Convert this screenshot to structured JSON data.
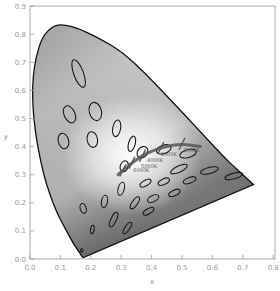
{
  "chart_data": {
    "type": "scatter",
    "title": "",
    "subtitle": "CIE 1931 chromaticity diagram with MacAdam ellipses and Planckian locus",
    "xlabel": "x",
    "ylabel": "y",
    "xlim": [
      0.0,
      0.8
    ],
    "ylim": [
      0.0,
      0.9
    ],
    "grid": false,
    "legend": null,
    "x_ticks": [
      "0.0",
      "0.1",
      "0.2",
      "0.3",
      "0.4",
      "0.5",
      "0.6",
      "0.7",
      "0.8"
    ],
    "y_ticks": [
      "0.0",
      "0.1",
      "0.2",
      "0.3",
      "0.4",
      "0.5",
      "0.6",
      "0.7",
      "0.8",
      "0.9"
    ],
    "spectral_locus": [
      [
        0.175,
        0.005
      ],
      [
        0.172,
        0.005
      ],
      [
        0.165,
        0.02
      ],
      [
        0.145,
        0.05
      ],
      [
        0.12,
        0.1
      ],
      [
        0.09,
        0.16
      ],
      [
        0.065,
        0.23
      ],
      [
        0.045,
        0.3
      ],
      [
        0.025,
        0.4
      ],
      [
        0.012,
        0.5
      ],
      [
        0.008,
        0.58
      ],
      [
        0.01,
        0.65
      ],
      [
        0.02,
        0.72
      ],
      [
        0.04,
        0.79
      ],
      [
        0.075,
        0.83
      ],
      [
        0.11,
        0.835
      ],
      [
        0.16,
        0.82
      ],
      [
        0.22,
        0.79
      ],
      [
        0.3,
        0.74
      ],
      [
        0.38,
        0.66
      ],
      [
        0.45,
        0.58
      ],
      [
        0.52,
        0.5
      ],
      [
        0.58,
        0.43
      ],
      [
        0.64,
        0.36
      ],
      [
        0.69,
        0.31
      ],
      [
        0.735,
        0.265
      ]
    ],
    "planckian_locus": {
      "points": [
        [
          0.29,
          0.3
        ],
        [
          0.31,
          0.32
        ],
        [
          0.345,
          0.35
        ],
        [
          0.38,
          0.375
        ],
        [
          0.44,
          0.4
        ],
        [
          0.5,
          0.41
        ],
        [
          0.56,
          0.4
        ]
      ],
      "labels": [
        {
          "text": "2000K",
          "x": 0.505,
          "y": 0.38
        },
        {
          "text": "3000K",
          "x": 0.43,
          "y": 0.365
        },
        {
          "text": "4000K",
          "x": 0.385,
          "y": 0.345
        },
        {
          "text": "5000K",
          "x": 0.365,
          "y": 0.325
        },
        {
          "text": "6000K",
          "x": 0.34,
          "y": 0.31
        }
      ]
    },
    "macadam_ellipses": [
      {
        "cx": 0.16,
        "cy": 0.66,
        "rx": 0.016,
        "ry": 0.052,
        "angle": -20
      },
      {
        "cx": 0.13,
        "cy": 0.515,
        "rx": 0.018,
        "ry": 0.032,
        "angle": -25
      },
      {
        "cx": 0.215,
        "cy": 0.525,
        "rx": 0.02,
        "ry": 0.033,
        "angle": -15
      },
      {
        "cx": 0.11,
        "cy": 0.42,
        "rx": 0.017,
        "ry": 0.028,
        "angle": -15
      },
      {
        "cx": 0.205,
        "cy": 0.425,
        "rx": 0.017,
        "ry": 0.028,
        "angle": -10
      },
      {
        "cx": 0.285,
        "cy": 0.465,
        "rx": 0.013,
        "ry": 0.03,
        "angle": 10
      },
      {
        "cx": 0.335,
        "cy": 0.41,
        "rx": 0.011,
        "ry": 0.028,
        "angle": 15
      },
      {
        "cx": 0.31,
        "cy": 0.33,
        "rx": 0.013,
        "ry": 0.02,
        "angle": 20
      },
      {
        "cx": 0.37,
        "cy": 0.38,
        "rx": 0.016,
        "ry": 0.022,
        "angle": 40
      },
      {
        "cx": 0.44,
        "cy": 0.39,
        "rx": 0.025,
        "ry": 0.015,
        "angle": -20
      },
      {
        "cx": 0.52,
        "cy": 0.375,
        "rx": 0.028,
        "ry": 0.014,
        "angle": -15
      },
      {
        "cx": 0.49,
        "cy": 0.32,
        "rx": 0.03,
        "ry": 0.011,
        "angle": -25
      },
      {
        "cx": 0.59,
        "cy": 0.315,
        "rx": 0.03,
        "ry": 0.011,
        "angle": -15
      },
      {
        "cx": 0.67,
        "cy": 0.295,
        "rx": 0.03,
        "ry": 0.01,
        "angle": -15
      },
      {
        "cx": 0.525,
        "cy": 0.28,
        "rx": 0.022,
        "ry": 0.01,
        "angle": -20
      },
      {
        "cx": 0.44,
        "cy": 0.275,
        "rx": 0.02,
        "ry": 0.01,
        "angle": -25
      },
      {
        "cx": 0.38,
        "cy": 0.27,
        "rx": 0.02,
        "ry": 0.01,
        "angle": -30
      },
      {
        "cx": 0.3,
        "cy": 0.25,
        "rx": 0.01,
        "ry": 0.024,
        "angle": 15
      },
      {
        "cx": 0.345,
        "cy": 0.2,
        "rx": 0.009,
        "ry": 0.025,
        "angle": 35
      },
      {
        "cx": 0.275,
        "cy": 0.14,
        "rx": 0.009,
        "ry": 0.028,
        "angle": 25
      },
      {
        "cx": 0.405,
        "cy": 0.215,
        "rx": 0.02,
        "ry": 0.011,
        "angle": -25
      },
      {
        "cx": 0.475,
        "cy": 0.235,
        "rx": 0.02,
        "ry": 0.01,
        "angle": -25
      },
      {
        "cx": 0.39,
        "cy": 0.17,
        "rx": 0.02,
        "ry": 0.009,
        "angle": -30
      },
      {
        "cx": 0.32,
        "cy": 0.11,
        "rx": 0.008,
        "ry": 0.024,
        "angle": 35
      },
      {
        "cx": 0.175,
        "cy": 0.18,
        "rx": 0.01,
        "ry": 0.018,
        "angle": -15
      },
      {
        "cx": 0.245,
        "cy": 0.205,
        "rx": 0.01,
        "ry": 0.022,
        "angle": 10
      },
      {
        "cx": 0.205,
        "cy": 0.105,
        "rx": 0.006,
        "ry": 0.015,
        "angle": 10
      },
      {
        "cx": 0.17,
        "cy": 0.03,
        "rx": 0.004,
        "ry": 0.006,
        "angle": 0
      }
    ]
  },
  "axes": {
    "xlabel": "x",
    "ylabel": "y"
  }
}
